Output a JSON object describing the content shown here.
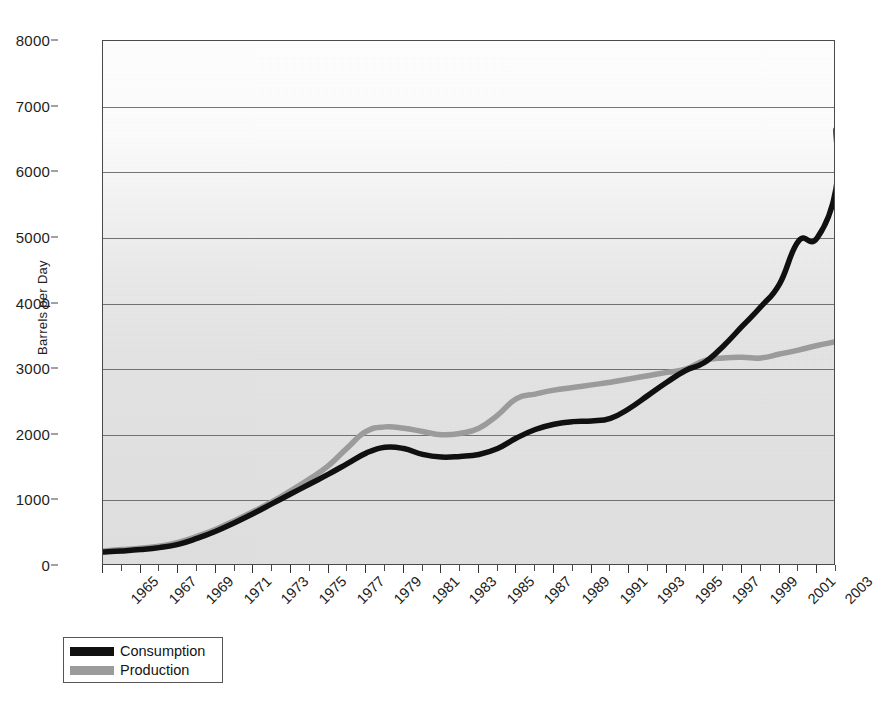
{
  "chart_data": {
    "type": "line",
    "title": "",
    "xlabel": "",
    "ylabel": "Barrels per Day",
    "xlim": [
      1965,
      2004
    ],
    "ylim": [
      0,
      8000
    ],
    "grid": true,
    "legend_position": "bottom-left",
    "y_ticks": [
      0,
      1000,
      2000,
      3000,
      4000,
      5000,
      6000,
      7000,
      8000
    ],
    "x_tick_labels": [
      "1965",
      "1967",
      "1969",
      "1971",
      "1973",
      "1975",
      "1977",
      "1979",
      "1981",
      "1983",
      "1985",
      "1987",
      "1989",
      "1991",
      "1993",
      "1995",
      "1997",
      "1999",
      "2001",
      "2003"
    ],
    "x": [
      1965,
      1966,
      1967,
      1968,
      1969,
      1970,
      1971,
      1972,
      1973,
      1974,
      1975,
      1976,
      1977,
      1978,
      1979,
      1980,
      1981,
      1982,
      1983,
      1984,
      1985,
      1986,
      1987,
      1988,
      1989,
      1990,
      1991,
      1992,
      1993,
      1994,
      1995,
      1996,
      1997,
      1998,
      1999,
      2000,
      2001,
      2002,
      2003,
      2004
    ],
    "series": [
      {
        "name": "Consumption",
        "color": "#101010",
        "values": [
          215,
          230,
          250,
          280,
          330,
          420,
          530,
          660,
          800,
          950,
          1100,
          1250,
          1400,
          1560,
          1720,
          1810,
          1790,
          1700,
          1660,
          1670,
          1700,
          1790,
          1950,
          2080,
          2160,
          2200,
          2210,
          2250,
          2400,
          2600,
          2800,
          2980,
          3100,
          3350,
          3650,
          3950,
          4300,
          4950,
          5000,
          5750
        ]
      },
      {
        "name": "Production",
        "color": "#9b9b9b",
        "values": [
          230,
          250,
          270,
          300,
          360,
          450,
          560,
          690,
          830,
          980,
          1150,
          1330,
          1530,
          1800,
          2050,
          2120,
          2100,
          2050,
          2000,
          2020,
          2100,
          2300,
          2550,
          2620,
          2680,
          2720,
          2760,
          2800,
          2850,
          2900,
          2950,
          3000,
          3130,
          3170,
          3180,
          3170,
          3230,
          3290,
          3360,
          3420
        ]
      }
    ],
    "series_endpoints": {
      "Consumption": 6650,
      "Production": 3430
    }
  },
  "legend": {
    "items": [
      {
        "label": "Consumption",
        "swatch": "black"
      },
      {
        "label": "Production",
        "swatch": "gray"
      }
    ]
  },
  "axis": {
    "y_title": "Barrels per Day"
  }
}
